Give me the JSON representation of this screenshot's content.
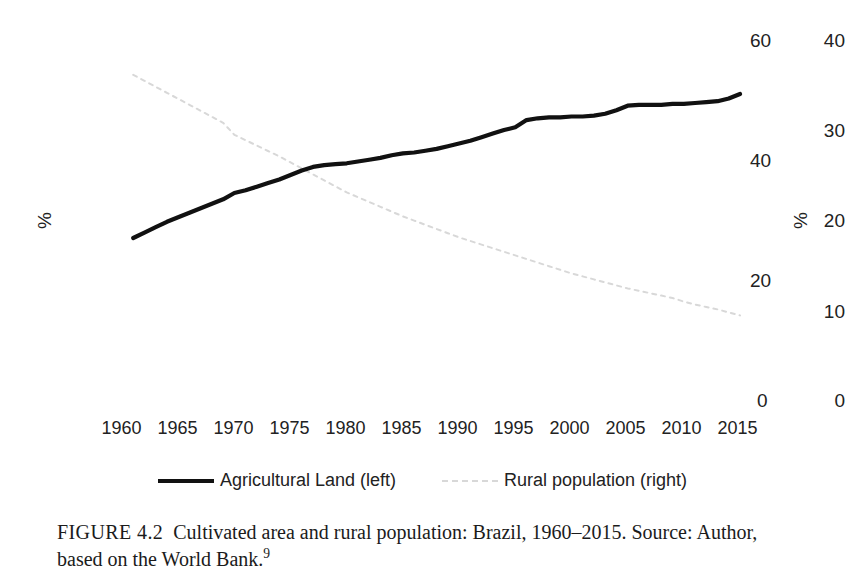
{
  "figure": {
    "caption_label": "FIGURE 4.2",
    "caption_title": "Cultivated area and rural population: Brazil, 1960–2015.",
    "caption_source": "Source: Author, based on the World Bank.",
    "caption_footnote": "9"
  },
  "legend": {
    "position": "bottom-center",
    "items": [
      {
        "label": "Agricultural Land (left)",
        "style": "solid",
        "color": "#111111",
        "swatch_icon": "solid-line-swatch"
      },
      {
        "label": "Rural population (right)",
        "style": "dotted",
        "color": "#d8d8d8",
        "swatch_icon": "dotted-line-swatch"
      }
    ]
  },
  "axes": {
    "left_unit": "%",
    "right_unit": "%",
    "left_ticks": [
      "40",
      "30",
      "20",
      "10",
      "0"
    ],
    "right_ticks": [
      "60",
      "40",
      "20",
      "0"
    ],
    "x_ticks": [
      "1960",
      "1965",
      "1970",
      "1975",
      "1980",
      "1985",
      "1990",
      "1995",
      "2000",
      "2005",
      "2010",
      "2015"
    ]
  },
  "chart_data": {
    "type": "line",
    "title": "Cultivated area and rural population: Brazil, 1960–2015",
    "xlabel": "",
    "ylabel": "%",
    "y2label": "%",
    "xlim": [
      1960,
      2015
    ],
    "ylim": [
      0,
      40
    ],
    "y2lim": [
      0,
      60
    ],
    "yticks": [
      0,
      10,
      20,
      30,
      40
    ],
    "y2ticks": [
      0,
      20,
      40,
      60
    ],
    "xticks": [
      1960,
      1965,
      1970,
      1975,
      1980,
      1985,
      1990,
      1995,
      2000,
      2005,
      2010,
      2015
    ],
    "grid": false,
    "legend_position": "bottom-center",
    "x": [
      1961,
      1962,
      1963,
      1964,
      1965,
      1966,
      1967,
      1968,
      1969,
      1970,
      1971,
      1972,
      1973,
      1974,
      1975,
      1976,
      1977,
      1978,
      1979,
      1980,
      1981,
      1982,
      1983,
      1984,
      1985,
      1986,
      1987,
      1988,
      1989,
      1990,
      1991,
      1992,
      1993,
      1994,
      1995,
      1996,
      1997,
      1998,
      1999,
      2000,
      2001,
      2002,
      2003,
      2004,
      2005,
      2006,
      2007,
      2008,
      2009,
      2010,
      2011,
      2012,
      2013,
      2014,
      2015
    ],
    "series": [
      {
        "name": "Agricultural Land (left)",
        "axis": "left",
        "style": "solid",
        "color": "#111111",
        "unit": "%",
        "values": [
          18.0,
          18.6,
          19.2,
          19.8,
          20.3,
          20.8,
          21.3,
          21.8,
          22.3,
          23.0,
          23.3,
          23.7,
          24.1,
          24.5,
          25.0,
          25.5,
          25.9,
          26.1,
          26.2,
          26.3,
          26.5,
          26.7,
          26.9,
          27.2,
          27.4,
          27.5,
          27.7,
          27.9,
          28.2,
          28.5,
          28.8,
          29.2,
          29.6,
          30.0,
          30.3,
          31.1,
          31.3,
          31.4,
          31.4,
          31.5,
          31.5,
          31.6,
          31.8,
          32.2,
          32.7,
          32.8,
          32.8,
          32.8,
          32.9,
          32.9,
          33.0,
          33.1,
          33.2,
          33.5,
          34.0
        ]
      },
      {
        "name": "Rural population (right)",
        "axis": "right",
        "style": "dotted",
        "color": "#d8d8d8",
        "unit": "%",
        "values": [
          54.2,
          53.2,
          52.2,
          51.2,
          50.2,
          49.2,
          48.2,
          47.2,
          46.2,
          44.2,
          43.3,
          42.4,
          41.5,
          40.6,
          39.6,
          38.6,
          37.6,
          36.6,
          35.6,
          34.6,
          33.8,
          33.0,
          32.2,
          31.4,
          30.6,
          29.9,
          29.2,
          28.5,
          27.8,
          27.1,
          26.5,
          25.9,
          25.3,
          24.7,
          24.1,
          23.5,
          22.9,
          22.3,
          21.7,
          21.1,
          20.6,
          20.1,
          19.6,
          19.1,
          18.6,
          18.2,
          17.8,
          17.4,
          17.0,
          16.4,
          15.9,
          15.5,
          15.1,
          14.6,
          14.1
        ]
      }
    ]
  }
}
